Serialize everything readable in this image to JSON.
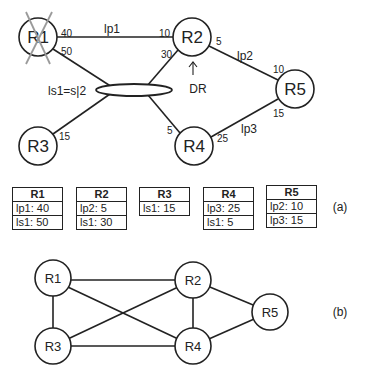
{
  "panel_a": {
    "label": "(a)",
    "nodes": [
      {
        "id": "R1",
        "label": "R1",
        "failed": true
      },
      {
        "id": "R2",
        "label": "R2",
        "annotation": "DR"
      },
      {
        "id": "R3",
        "label": "R3"
      },
      {
        "id": "R4",
        "label": "R4"
      },
      {
        "id": "R5",
        "label": "R5"
      }
    ],
    "links": {
      "lp1": {
        "label": "lp1",
        "cost_R1": "40",
        "cost_R2": "10"
      },
      "lp2": {
        "label": "lp2",
        "cost_R2": "5",
        "cost_R5": "10"
      },
      "lp3": {
        "label": "lp3",
        "cost_R4": "25",
        "cost_R5": "15"
      },
      "ls1": {
        "label": "ls1=s|2",
        "cost_R1": "50",
        "cost_R2": "30",
        "cost_R3": "15",
        "cost_R4": "5"
      }
    },
    "dr_label": "DR",
    "tables": [
      {
        "title": "R1",
        "rows": [
          "lp1: 40",
          "ls1: 50"
        ]
      },
      {
        "title": "R2",
        "rows": [
          "lp2: 5",
          "ls1: 30"
        ]
      },
      {
        "title": "R3",
        "rows": [
          "ls1: 15"
        ]
      },
      {
        "title": "R4",
        "rows": [
          "lp3: 25",
          "ls1: 5"
        ]
      },
      {
        "title": "R5",
        "rows": [
          "lp2: 10",
          "lp3: 15"
        ]
      }
    ]
  },
  "panel_b": {
    "label": "(b)",
    "nodes": [
      "R1",
      "R2",
      "R3",
      "R4",
      "R5"
    ],
    "edges": [
      [
        "R1",
        "R2"
      ],
      [
        "R1",
        "R3"
      ],
      [
        "R1",
        "R4"
      ],
      [
        "R2",
        "R3"
      ],
      [
        "R2",
        "R4"
      ],
      [
        "R2",
        "R5"
      ],
      [
        "R3",
        "R4"
      ],
      [
        "R4",
        "R5"
      ]
    ]
  },
  "colors": {
    "line": "#222222",
    "failure_cross": "#9a9a9a",
    "background": "#ffffff"
  }
}
